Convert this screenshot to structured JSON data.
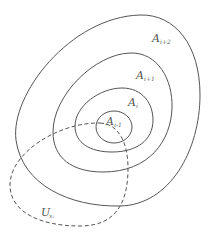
{
  "diagram": {
    "type": "nested-sets",
    "stroke_color": "#555555",
    "sets": [
      {
        "id": "A_i+2",
        "label": "A",
        "subscript": "i+2",
        "style": "solid"
      },
      {
        "id": "A_i+1",
        "label": "A",
        "subscript": "i+1",
        "style": "solid"
      },
      {
        "id": "A_i",
        "label": "A",
        "subscript": "i",
        "style": "solid"
      },
      {
        "id": "A_i-1",
        "label": "A",
        "subscript": "i-1",
        "style": "solid"
      }
    ],
    "neighborhood": {
      "id": "U_xi",
      "label": "U",
      "subscript": "xᵢ",
      "style": "dashed"
    }
  }
}
